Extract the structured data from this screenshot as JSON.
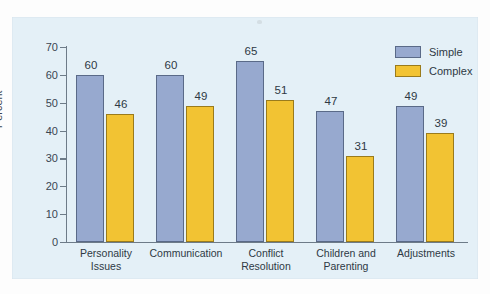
{
  "chart_data": {
    "type": "bar",
    "title": "",
    "xlabel": "",
    "ylabel": "Percent",
    "ylim": [
      0,
      70
    ],
    "yticks": [
      0,
      10,
      20,
      30,
      40,
      50,
      60,
      70
    ],
    "grid": false,
    "legend_position": "top-right",
    "categories": [
      "Personality\nIssues",
      "Communication",
      "Conflict\nResolution",
      "Children and\nParenting",
      "Adjustments"
    ],
    "series": [
      {
        "name": "Simple",
        "color": "#97a9cf",
        "values": [
          60,
          60,
          65,
          47,
          49
        ]
      },
      {
        "name": "Complex",
        "color": "#f2c333",
        "values": [
          46,
          49,
          51,
          31,
          39
        ]
      }
    ]
  },
  "legend": {
    "items": [
      {
        "label": "Simple"
      },
      {
        "label": "Complex"
      }
    ]
  },
  "colors": {
    "panel_background": "#e4f0f7",
    "page_background": "#fdfdfd",
    "axis": "#6d7b88",
    "simple_fill": "#97a9cf",
    "simple_border": "#5a6a88",
    "complex_fill": "#f2c333",
    "complex_border": "#9a7b1c",
    "text": "#2e3944"
  }
}
